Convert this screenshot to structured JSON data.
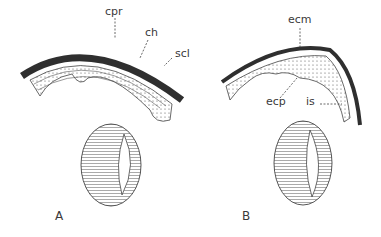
{
  "figure": {
    "panels": [
      {
        "id": "A",
        "caption": "A",
        "labels": [
          {
            "text": "cpr",
            "meaning": "label"
          },
          {
            "text": "ch",
            "meaning": "label"
          },
          {
            "text": "scl",
            "meaning": "label"
          }
        ]
      },
      {
        "id": "B",
        "caption": "B",
        "labels": [
          {
            "text": "ecm",
            "meaning": "label"
          },
          {
            "text": "ecp",
            "meaning": "label"
          },
          {
            "text": "is",
            "meaning": "label"
          }
        ]
      }
    ],
    "colors": {
      "ink": "#3a3a3a",
      "dark_band": "#2f2f2f",
      "background": "#ffffff"
    }
  }
}
